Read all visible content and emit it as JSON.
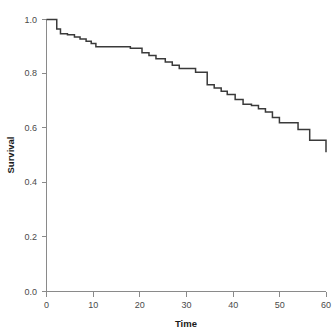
{
  "chart_data": {
    "type": "line",
    "subtype": "kaplan-meier-step",
    "title": "",
    "xlabel": "Time",
    "ylabel": "Survival",
    "xlim": [
      0,
      60
    ],
    "ylim": [
      0.0,
      1.0
    ],
    "xticks": [
      0,
      10,
      20,
      30,
      40,
      50,
      60
    ],
    "xtick_labels": [
      "0",
      "10",
      "20",
      "30",
      "40",
      "50",
      "60"
    ],
    "yticks": [
      0.0,
      0.2,
      0.4,
      0.6,
      0.8,
      1.0
    ],
    "ytick_labels": [
      "0.0",
      "0.2",
      "0.4",
      "0.6",
      "0.8",
      "1.0"
    ],
    "grid": false,
    "legend": false,
    "legend_position": "none",
    "line_color": "#3a3a3a",
    "background_color": "#ffffff",
    "axis_color": "#8a8a8a",
    "series": [
      {
        "name": "Survival",
        "step": "post",
        "x": [
          0,
          1.5,
          2.2,
          3.0,
          4.5,
          6.0,
          7.2,
          8.5,
          9.6,
          10.6,
          18.0,
          19.0,
          20.5,
          22.0,
          23.5,
          25.5,
          27.0,
          28.5,
          32.0,
          33.0,
          34.5,
          36.0,
          37.5,
          38.8,
          40.5,
          42.2,
          44.0,
          45.5,
          47.0,
          48.5,
          50.0,
          54.0,
          55.5,
          56.5,
          60.0
        ],
        "y": [
          1.0,
          1.0,
          0.965,
          0.948,
          0.944,
          0.936,
          0.928,
          0.92,
          0.912,
          0.9,
          0.894,
          0.894,
          0.878,
          0.868,
          0.856,
          0.844,
          0.832,
          0.82,
          0.806,
          0.806,
          0.76,
          0.748,
          0.736,
          0.724,
          0.706,
          0.688,
          0.684,
          0.672,
          0.66,
          0.64,
          0.62,
          0.596,
          0.596,
          0.556,
          0.512
        ]
      }
    ],
    "annotations": []
  },
  "axes": {
    "x_title": "Time",
    "y_title": "Survival"
  }
}
